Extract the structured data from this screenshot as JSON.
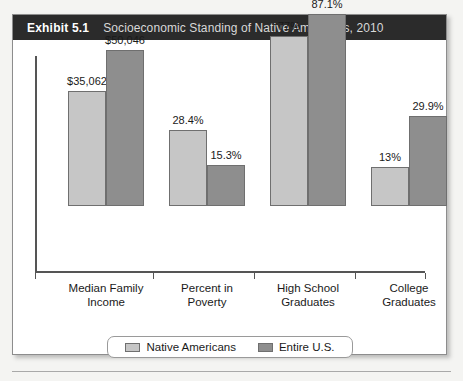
{
  "exhibit": {
    "label": "Exhibit 5.1",
    "title": "Socioeconomic Standing of Native Americans, 2010"
  },
  "colors": {
    "header_background": "#2b2b2b",
    "header_label_text": "#ffffff",
    "header_title_text": "#d8d8d8",
    "series_native_americans": "#c6c6c6",
    "series_entire_us": "#8e8e8e",
    "bar_outline": "#6f6f6f",
    "axis": "#555555",
    "panel_background": "#ffffff",
    "page_background": "#f4f4f2"
  },
  "chart_data": {
    "type": "bar",
    "title": "Socioeconomic Standing of Native Americans, 2010",
    "xlabel": "",
    "ylabel": "",
    "grid": false,
    "legend_position": "bottom",
    "categories": [
      "Median Family\nIncome",
      "Percent in\nPoverty",
      "High School\nGraduates",
      "College\nGraduates"
    ],
    "category_lines": [
      [
        "Median Family",
        "Income"
      ],
      [
        "Percent in",
        "Poverty"
      ],
      [
        "High School",
        "Graduates"
      ],
      [
        "College",
        "Graduates"
      ]
    ],
    "series": [
      {
        "name": "Native Americans",
        "color": "#c6c6c6",
        "values": [
          35062,
          28.4,
          77,
          13
        ],
        "labels": [
          "$35,062",
          "28.4%",
          "77%",
          "13%"
        ]
      },
      {
        "name": "Entire U.S.",
        "color": "#8e8e8e",
        "values": [
          50046,
          15.3,
          87.1,
          29.9
        ],
        "labels": [
          "$50,046",
          "15.3%",
          "87.1%",
          "29.9%"
        ]
      }
    ],
    "bar_pixel_heights": [
      [
        115,
        76,
        170,
        39
      ],
      [
        156,
        41,
        192,
        90
      ]
    ]
  },
  "legend": {
    "items": [
      {
        "label": "Native Americans",
        "swatch": "light"
      },
      {
        "label": "Entire U.S.",
        "swatch": "dark"
      }
    ]
  }
}
